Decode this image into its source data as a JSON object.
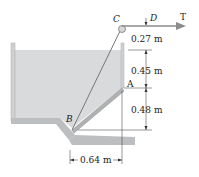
{
  "diagram": {
    "points": {
      "A": "A",
      "B": "B",
      "C": "C",
      "D": "D"
    },
    "force": "T",
    "dimensions": {
      "cd_vertical": "0.27 m",
      "water_to_A": "0.45 m",
      "A_to_bottom": "0.48 m",
      "horizontal_B_to_A": "0.64 m"
    },
    "colors": {
      "water": "#d9dadb",
      "structure": "#9a9b9c",
      "arrow": "#8a8c8e",
      "line": "#333333"
    }
  }
}
